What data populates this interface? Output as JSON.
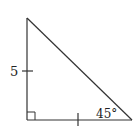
{
  "diagram": {
    "type": "right-triangle",
    "colors": {
      "stroke": "#333333",
      "text": "#222222",
      "background": "#ffffff"
    },
    "vertices": {
      "top": [
        27,
        18
      ],
      "bottom_left": [
        27,
        120
      ],
      "bottom_right": [
        132,
        120
      ]
    },
    "right_angle_marker": {
      "corner": "bottom_left",
      "size": 8
    },
    "side_labels": {
      "vertical_leg": "5"
    },
    "angle_labels": {
      "bottom_right": "45°"
    },
    "tick_marks": [
      {
        "side": "vertical_leg",
        "position": [
          27,
          71
        ]
      },
      {
        "side": "horizontal_leg",
        "position": [
          78,
          120
        ]
      }
    ]
  }
}
